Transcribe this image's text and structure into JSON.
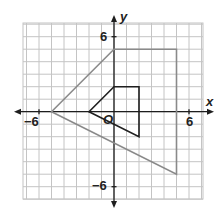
{
  "figure": {
    "type": "coordinate-plane",
    "grid": {
      "xmin": -7,
      "xmax": 7,
      "ymin": -7,
      "ymax": 7,
      "step": 1
    },
    "axes": {
      "x_label": "x",
      "y_label": "y",
      "origin_label": "O",
      "tick_labels": {
        "x_neg": "−6",
        "x_pos": "6",
        "y_pos": "6",
        "y_neg": "−6"
      }
    },
    "shapes": [
      {
        "name": "large-quadrilateral",
        "vertices": [
          [
            -5,
            0
          ],
          [
            0,
            5
          ],
          [
            5,
            5
          ],
          [
            5,
            -5
          ]
        ],
        "color": "#8a8a8a"
      },
      {
        "name": "small-quadrilateral",
        "vertices": [
          [
            -2,
            0
          ],
          [
            0,
            2
          ],
          [
            2,
            2
          ],
          [
            2,
            -2
          ]
        ],
        "color": "#1e1e1e"
      }
    ],
    "colors": {
      "grid": "#c4c4c4",
      "axis": "#1e1e1e"
    }
  }
}
